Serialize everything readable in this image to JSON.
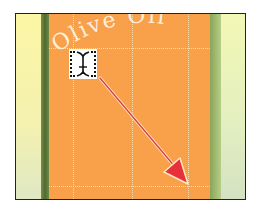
{
  "canvas": {
    "arc_text": "Olive Oil",
    "colors": {
      "background": "#ffffff",
      "frame_border": "#222222",
      "orange_panel": "#f8a04a",
      "left_pale_strip": "#fbf6a4",
      "left_dark_strip": "#4e6a30",
      "right_green_strip": "#9fba6e",
      "right_pale_strip": "#e3efc0",
      "guide": "#ffebbe",
      "arrow": "#e8303a",
      "arrow_outline": "#ffe8c0",
      "text": "#fff6e6"
    }
  },
  "cursor": {
    "icon": "vertical-type-path-cursor-icon"
  },
  "annotation": {
    "arrow": "drag-direction-arrow"
  }
}
